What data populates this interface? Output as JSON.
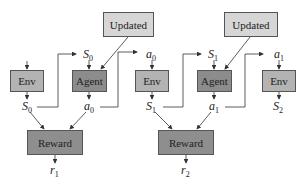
{
  "diagram": {
    "title": "",
    "nodes": {
      "updated_0": {
        "label": "Updated"
      },
      "updated_1": {
        "label": "Updated"
      },
      "env_0": {
        "label": "Env"
      },
      "agent_0": {
        "label": "Agent"
      },
      "env_1": {
        "label": "Env"
      },
      "agent_1": {
        "label": "Agent"
      },
      "env_2": {
        "label": "Env"
      },
      "reward_0": {
        "label": "Reward"
      },
      "reward_1": {
        "label": "Reward"
      }
    },
    "symbols": {
      "s0_top": {
        "base": "S",
        "sub": "0"
      },
      "s0_bottom": {
        "base": "S",
        "sub": "0"
      },
      "a0_bottom": {
        "base": "a",
        "sub": "0"
      },
      "a0_top": {
        "base": "a",
        "sub": "0"
      },
      "s1_bottom": {
        "base": "S",
        "sub": "1"
      },
      "s1_top": {
        "base": "S",
        "sub": "1"
      },
      "a1_bottom": {
        "base": "a",
        "sub": "1"
      },
      "a1_top": {
        "base": "a",
        "sub": "1"
      },
      "s2_bottom": {
        "base": "S",
        "sub": "2"
      },
      "r1": {
        "base": "r",
        "sub": "1"
      },
      "r2": {
        "base": "r",
        "sub": "2"
      }
    },
    "colors": {
      "updated_fill": "#d6d6d6",
      "env_fill": "#b3b3b3",
      "agent_fill": "#8c8c8c",
      "reward_fill": "#8e8e8e",
      "line": "#333333"
    }
  }
}
